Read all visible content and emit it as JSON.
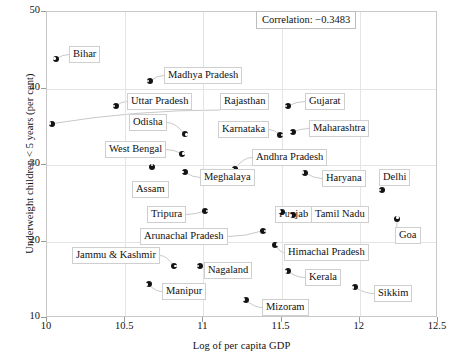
{
  "chart_data": {
    "type": "scatter",
    "title": "",
    "xlabel": "Log of per capita GDP",
    "ylabel": "Underweight children < 5 years (per cent)",
    "xlim": [
      10,
      12.5
    ],
    "ylim": [
      10,
      50
    ],
    "xticks": [
      "10",
      "10.5",
      "11",
      "11.5",
      "12",
      "12.5"
    ],
    "yticks": [
      "50",
      "40",
      "30",
      "20",
      "10"
    ],
    "grid": true,
    "annotation": "Correlation: −0.3483",
    "correlation": -0.3483,
    "points": [
      {
        "label": "Bihar",
        "x": 10.06,
        "y": 43.9,
        "notch": "w",
        "lx": 68,
        "ly": 45
      },
      {
        "label": "Madhya Pradesh",
        "x": 10.66,
        "y": 41.0,
        "notch": "w",
        "lx": 163,
        "ly": 66
      },
      {
        "label": "Uttar Pradesh",
        "x": 10.44,
        "y": 37.7,
        "notch": "w",
        "lx": 126,
        "ly": 92
      },
      {
        "label": "Rajasthan",
        "x": 10.03,
        "y": 35.4,
        "notch": "w",
        "lx": 219,
        "ly": 92
      },
      {
        "label": "Gujarat",
        "x": 11.54,
        "y": 37.7,
        "notch": "w",
        "lx": 304,
        "ly": 92
      },
      {
        "label": "Odisha",
        "x": 10.88,
        "y": 34.0,
        "notch": "e",
        "lx": 128,
        "ly": 113
      },
      {
        "label": "Karnataka",
        "x": 11.49,
        "y": 33.9,
        "notch": "e",
        "lx": 217,
        "ly": 120
      },
      {
        "label": "Maharashtra",
        "x": 11.57,
        "y": 34.3,
        "notch": "w",
        "lx": 308,
        "ly": 119
      },
      {
        "label": "West Bengal",
        "x": 10.86,
        "y": 31.5,
        "notch": "e",
        "lx": 104,
        "ly": 140
      },
      {
        "label": "Andhra Pradesh",
        "x": 11.2,
        "y": 29.5,
        "notch": "w",
        "lx": 251,
        "ly": 148
      },
      {
        "label": "Assam",
        "x": 10.67,
        "y": 29.7,
        "notch": "n",
        "lx": 131,
        "ly": 180
      },
      {
        "label": "Meghalaya",
        "x": 10.88,
        "y": 29.1,
        "notch": "w",
        "lx": 199,
        "ly": 168
      },
      {
        "label": "Haryana",
        "x": 11.65,
        "y": 29.0,
        "notch": "w",
        "lx": 321,
        "ly": 169
      },
      {
        "label": "Delhi",
        "x": 12.14,
        "y": 26.7,
        "notch": "w",
        "lx": 378,
        "ly": 168
      },
      {
        "label": "Tripura",
        "x": 11.01,
        "y": 24.0,
        "notch": "e",
        "lx": 146,
        "ly": 205
      },
      {
        "label": "Punjab",
        "x": 11.5,
        "y": 23.9,
        "notch": "w",
        "lx": 274,
        "ly": 205
      },
      {
        "label": "Tamil Nadu",
        "x": 11.57,
        "y": 23.4,
        "notch": "w",
        "lx": 310,
        "ly": 205
      },
      {
        "label": "Goa",
        "x": 12.24,
        "y": 22.9,
        "notch": "n",
        "lx": 394,
        "ly": 226
      },
      {
        "label": "Arunachal Pradesh",
        "x": 11.38,
        "y": 21.4,
        "notch": "e",
        "lx": 139,
        "ly": 227
      },
      {
        "label": "Himachal Pradesh",
        "x": 11.46,
        "y": 19.6,
        "notch": "e",
        "lx": 283,
        "ly": 243
      },
      {
        "label": "Jammu & Kashmir",
        "x": 10.81,
        "y": 16.8,
        "notch": "e",
        "lx": 71,
        "ly": 246
      },
      {
        "label": "Nagaland",
        "x": 10.98,
        "y": 16.8,
        "notch": "w",
        "lx": 203,
        "ly": 261
      },
      {
        "label": "Kerala",
        "x": 11.54,
        "y": 16.1,
        "notch": "w",
        "lx": 304,
        "ly": 268
      },
      {
        "label": "Sikkim",
        "x": 11.97,
        "y": 14.0,
        "notch": "w",
        "lx": 373,
        "ly": 284
      },
      {
        "label": "Manipur",
        "x": 10.65,
        "y": 14.4,
        "notch": "w",
        "lx": 161,
        "ly": 282
      },
      {
        "label": "Mizoram",
        "x": 11.27,
        "y": 12.4,
        "notch": "w",
        "lx": 261,
        "ly": 298
      }
    ]
  }
}
